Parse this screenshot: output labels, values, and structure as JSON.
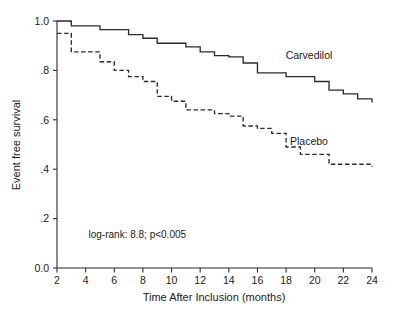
{
  "chart_data": {
    "type": "line",
    "subtype": "kaplan-meier-step",
    "title": "",
    "xlabel": "Time After Inclusion (months)",
    "ylabel": "Event free survival",
    "xlim": [
      2,
      24
    ],
    "ylim": [
      0.0,
      1.0
    ],
    "grid": false,
    "legend_position": "inline-curve-labels",
    "x_ticks": [
      2,
      4,
      6,
      8,
      10,
      12,
      14,
      16,
      18,
      20,
      22,
      24
    ],
    "x_tick_labels": [
      "2",
      "4",
      "6",
      "8",
      "10",
      "12",
      "14",
      "16",
      "18",
      "20",
      "22",
      "24"
    ],
    "y_ticks": [
      0.0,
      0.2,
      0.4,
      0.6,
      0.8,
      1.0
    ],
    "y_tick_labels": [
      "0.0",
      ".2",
      ".4",
      ".6",
      ".8",
      "1.0"
    ],
    "annotations": [
      {
        "name": "log-rank-statistic",
        "text": "log-rank: 8.8; p<0.005",
        "x": 4.2,
        "y": 0.12
      }
    ],
    "series": [
      {
        "name": "Carvedilol",
        "label": "Carvedilol",
        "style": "solid",
        "color": "#2b2b2b",
        "label_x": 19.6,
        "label_y": 0.845,
        "x": [
          2,
          3,
          5,
          7,
          8,
          9,
          11,
          12,
          13,
          14,
          15,
          16,
          18,
          20,
          21,
          22,
          23,
          24
        ],
        "y": [
          1.0,
          0.98,
          0.965,
          0.945,
          0.93,
          0.91,
          0.895,
          0.875,
          0.86,
          0.855,
          0.83,
          0.79,
          0.775,
          0.755,
          0.72,
          0.705,
          0.685,
          0.67
        ]
      },
      {
        "name": "Placebo",
        "label": "Placebo",
        "style": "dashed",
        "color": "#2b2b2b",
        "label_x": 19.6,
        "label_y": 0.5,
        "x": [
          2,
          3,
          5,
          6,
          7,
          8,
          9,
          10,
          11,
          13,
          14,
          15,
          16,
          17,
          18,
          19,
          21,
          24
        ],
        "y": [
          0.95,
          0.875,
          0.835,
          0.8,
          0.775,
          0.755,
          0.695,
          0.675,
          0.64,
          0.625,
          0.615,
          0.575,
          0.565,
          0.545,
          0.49,
          0.46,
          0.42,
          0.41
        ]
      }
    ]
  },
  "axes": {
    "x_title": "Time After Inclusion (months)",
    "y_title": "Event free survival"
  }
}
